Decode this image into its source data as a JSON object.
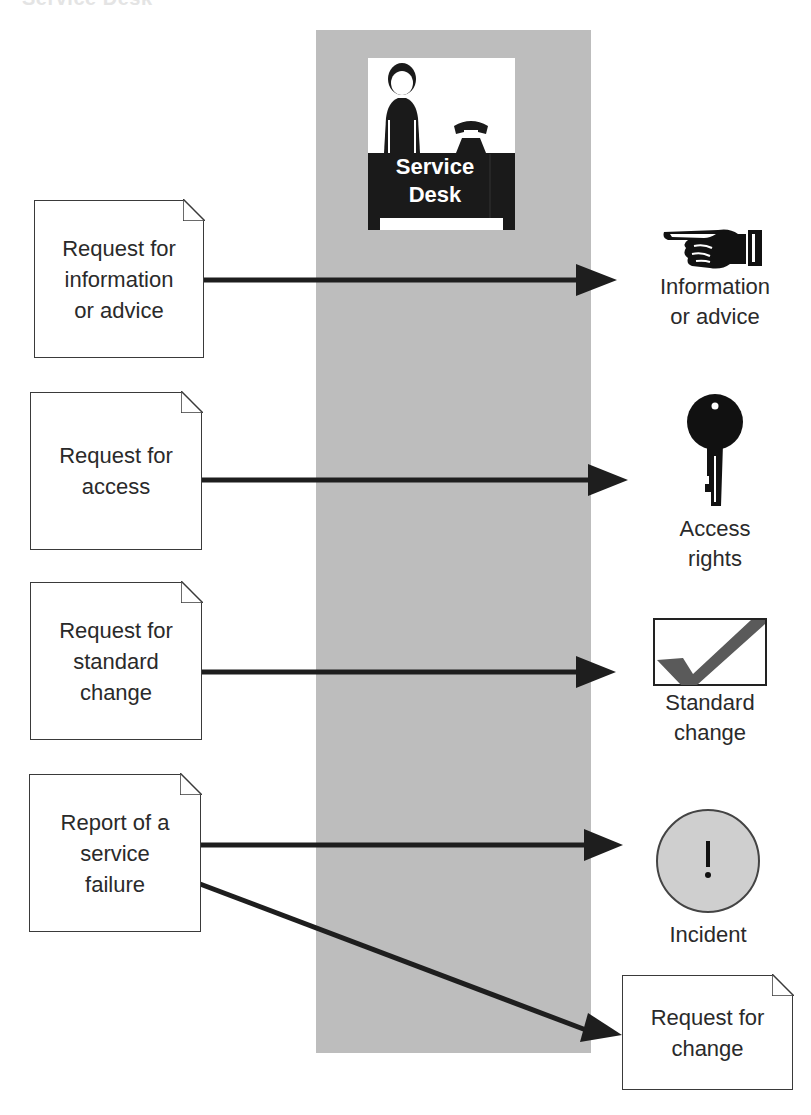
{
  "page_title": "Service Desk",
  "colors": {
    "column": "#bdbdbd",
    "arrow": "#1e1e1e",
    "doc_border": "#3a3a3a",
    "incident_fill": "#cfcfcf",
    "check": "#5a5a5a"
  },
  "hub": {
    "label": "Service\nDesk",
    "icon": "service-desk-person-phone-icon"
  },
  "inputs": [
    {
      "label": "Request for\ninformation\nor advice",
      "icon": "document-icon"
    },
    {
      "label": "Request for\naccess",
      "icon": "document-icon"
    },
    {
      "label": "Request for\nstandard\nchange",
      "icon": "document-icon"
    },
    {
      "label": "Report of a\nservice\nfailure",
      "icon": "document-icon"
    }
  ],
  "outputs": [
    {
      "label": "Information\nor advice",
      "icon": "pointing-hand-icon"
    },
    {
      "label": "Access\nrights",
      "icon": "key-icon"
    },
    {
      "label": "Standard\nchange",
      "icon": "checkmark-box-icon"
    },
    {
      "label": "Incident",
      "icon": "exclamation-circle-icon",
      "glyph": "!"
    },
    {
      "label": "Request for\nchange",
      "icon": "document-icon"
    }
  ],
  "flows": [
    {
      "from": "Request for information or advice",
      "to": "Information or advice"
    },
    {
      "from": "Request for access",
      "to": "Access rights"
    },
    {
      "from": "Request for standard change",
      "to": "Standard change"
    },
    {
      "from": "Report of a service failure",
      "to": "Incident"
    },
    {
      "from": "Report of a service failure",
      "to": "Request for change"
    }
  ]
}
